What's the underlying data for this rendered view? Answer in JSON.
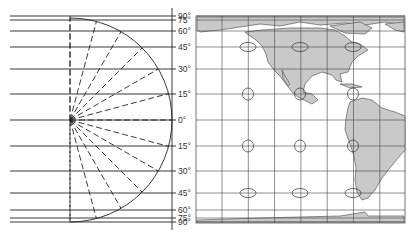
{
  "diagram": {
    "type": "Mercator projection construction and world map",
    "latitude_labels": [
      "90°",
      "75°",
      "60°",
      "45°",
      "30°",
      "15°",
      "0°",
      "15°",
      "30°",
      "45°",
      "60°",
      "75°",
      "90°"
    ],
    "latitudes_deg": [
      90,
      75,
      60,
      45,
      30,
      15,
      0,
      -15,
      -30,
      -45,
      -60,
      -75,
      -90
    ],
    "latitude_line_y": [
      16,
      20,
      31,
      47,
      69,
      94,
      120,
      146,
      171,
      193,
      210,
      218,
      222
    ],
    "colors": {
      "line": "#222222",
      "land": "#c9c9c9",
      "grid": "#444444",
      "label": "#333333"
    },
    "left_panel": {
      "description": "Semicircle with dashed radial lines from center to each latitude, projected to horizontal parallels"
    },
    "right_panel": {
      "description": "Mercator map of the Americas with grid and Tissot indicatrix ellipses",
      "indicatrix_rows_deg": [
        60,
        15,
        -15,
        -45
      ]
    }
  }
}
